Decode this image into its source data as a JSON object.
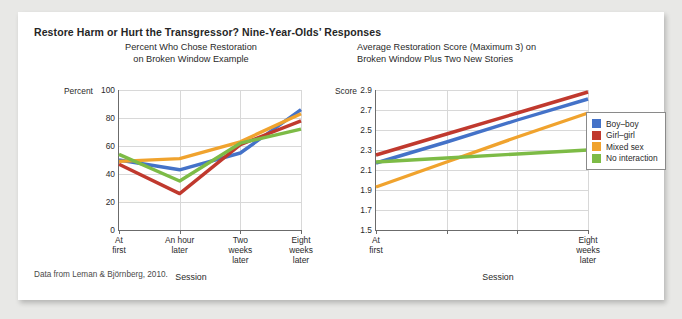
{
  "figure": {
    "title": "Restore Harm or Hurt the Transgressor? Nine-Year-Olds’ Responses",
    "source_note": "Data from Leman & Björnberg, 2010."
  },
  "colors": {
    "boy_boy": "#4472C8",
    "girl_girl": "#C0392E",
    "mixed_sex": "#F0A32E",
    "no_interaction": "#7DBB46",
    "gridline": "#d8d8d8",
    "axis": "#6b6b6b",
    "card_background": "#ffffff",
    "page_background": "#e8e8e6"
  },
  "legend": {
    "position": "right",
    "entries": [
      {
        "label": "Boy–boy",
        "color": "#4472C8"
      },
      {
        "label": "Girl–girl",
        "color": "#C0392E"
      },
      {
        "label": "Mixed sex",
        "color": "#F0A32E"
      },
      {
        "label": "No interaction",
        "color": "#7DBB46"
      }
    ]
  },
  "chart_data": [
    {
      "id": "left",
      "type": "line",
      "title": "Percent Who Chose Restoration\non Broken Window Example",
      "title_line1": "Percent Who Chose Restoration",
      "title_line2": "on Broken Window Example",
      "xlabel": "Session",
      "ylabel": "Percent",
      "grid": true,
      "ylim": [
        0,
        100
      ],
      "yticks": [
        0,
        20,
        40,
        60,
        80,
        100
      ],
      "ytick_labels": [
        "0",
        "20",
        "40",
        "60",
        "80",
        "100"
      ],
      "categories": [
        "At first",
        "An hour later",
        "Two weeks later",
        "Eight weeks later"
      ],
      "category_lines": [
        [
          "At",
          "first"
        ],
        [
          "An hour",
          "later"
        ],
        [
          "Two",
          "weeks",
          "later"
        ],
        [
          "Eight",
          "weeks",
          "later"
        ]
      ],
      "series": [
        {
          "name": "Boy–boy",
          "color": "#4472C8",
          "values": [
            50,
            43,
            55,
            86
          ]
        },
        {
          "name": "Girl–girl",
          "color": "#C0392E",
          "values": [
            47,
            26,
            61,
            78
          ]
        },
        {
          "name": "Mixed sex",
          "color": "#F0A32E",
          "values": [
            49,
            51,
            63,
            83
          ]
        },
        {
          "name": "No interaction",
          "color": "#7DBB46",
          "values": [
            54,
            35,
            62,
            72
          ]
        }
      ]
    },
    {
      "id": "right",
      "type": "line",
      "title": "Average Restoration Score (Maximum 3) on\nBroken Window Plus Two New Stories",
      "title_line1": "Average Restoration Score (Maximum 3) on",
      "title_line2": "Broken Window Plus Two New Stories",
      "xlabel": "Session",
      "ylabel": "Score",
      "grid": true,
      "ylim": [
        1.5,
        2.9
      ],
      "yticks": [
        1.5,
        1.7,
        1.9,
        2.1,
        2.3,
        2.5,
        2.7,
        2.9
      ],
      "ytick_labels": [
        "1.5",
        "1.7",
        "1.9",
        "2.1",
        "2.3",
        "2.5",
        "2.7",
        "2.9"
      ],
      "categories": [
        "At first",
        "An hour later",
        "Two weeks later",
        "Eight weeks later"
      ],
      "category_lines": [
        [
          "At",
          "first"
        ],
        [],
        [],
        [
          "Eight",
          "weeks",
          "later"
        ]
      ],
      "labeled_ticks": [
        0,
        3
      ],
      "series": [
        {
          "name": "Boy–boy",
          "color": "#4472C8",
          "values": [
            2.17,
            2.38,
            2.6,
            2.81
          ]
        },
        {
          "name": "Girl–girl",
          "color": "#C0392E",
          "values": [
            2.25,
            2.46,
            2.67,
            2.88
          ]
        },
        {
          "name": "Mixed sex",
          "color": "#F0A32E",
          "values": [
            1.93,
            2.18,
            2.43,
            2.67
          ]
        },
        {
          "name": "No interaction",
          "color": "#7DBB46",
          "values": [
            2.18,
            2.22,
            2.26,
            2.3
          ]
        }
      ]
    }
  ]
}
